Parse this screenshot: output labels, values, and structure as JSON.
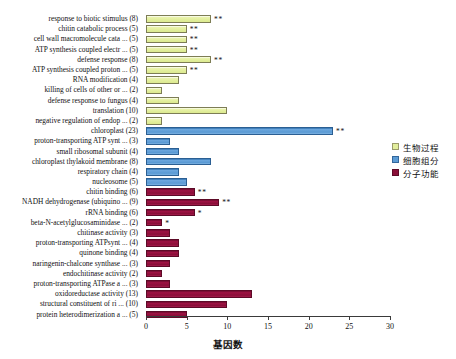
{
  "chart_data": {
    "type": "bar",
    "title": "",
    "orientation": "horizontal",
    "xlabel": "基因数",
    "ylabel": "",
    "xlim": [
      0,
      30
    ],
    "xticks": [
      0,
      5,
      10,
      15,
      20,
      25,
      30
    ],
    "xtick_labels": [
      "0",
      "5",
      "10",
      "15",
      "20",
      "25",
      "30"
    ],
    "grid": false,
    "legend_position": "right",
    "legend": [
      {
        "key": "bp",
        "label": "生物过程",
        "color": "#e2ee9c"
      },
      {
        "key": "cc",
        "label": "细胞组分",
        "color": "#5b9bd5"
      },
      {
        "key": "mf",
        "label": "分子功能",
        "color": "#8a0f38"
      }
    ],
    "categories": [
      "response to biotic stimulus (8)",
      "chitin catabolic process (5)",
      "cell wall macromolecule cata ... (5)",
      "ATP synthesis coupled electr ... (5)",
      "defense response (8)",
      "ATP synthesis coupled proton ... (5)",
      "RNA modification (4)",
      "killing of cells of other or ... (2)",
      "defense response to fungus (4)",
      "translation (10)",
      "negative regulation of endop ... (2)",
      "chloroplast (23)",
      "proton-transporting ATP synt ... (3)",
      "small ribosomal subunit (4)",
      "chloroplast thylakoid membrane (8)",
      "respiratory chain (4)",
      "nucleosome (5)",
      "chitin binding (6)",
      "NADH dehydrogenase (ubiquino ... (9)",
      "rRNA binding (6)",
      "beta-N-acetylglucosaminidase ... (2)",
      "chitinase activity (3)",
      "proton-transporting ATPsynt ... (4)",
      "quinone binding (4)",
      "naringenin-chalcone synthase ... (3)",
      "endochitinase activity (2)",
      "proton-transporting ATPase a ... (3)",
      "oxidoreductase activity (13)",
      "structural constituent of ri ... (10)",
      "protein heterodimerization a ... (5)"
    ],
    "values": [
      8,
      5,
      5,
      5,
      8,
      5,
      4,
      2,
      4,
      10,
      2,
      23,
      3,
      4,
      8,
      4,
      5,
      6,
      9,
      6,
      2,
      3,
      4,
      4,
      3,
      2,
      3,
      13,
      10,
      5
    ],
    "groups": [
      "bp",
      "bp",
      "bp",
      "bp",
      "bp",
      "bp",
      "bp",
      "bp",
      "bp",
      "bp",
      "bp",
      "cc",
      "cc",
      "cc",
      "cc",
      "cc",
      "cc",
      "mf",
      "mf",
      "mf",
      "mf",
      "mf",
      "mf",
      "mf",
      "mf",
      "mf",
      "mf",
      "mf",
      "mf",
      "mf"
    ],
    "significance": [
      "**",
      "**",
      "**",
      "**",
      "**",
      "**",
      "",
      "",
      "",
      "",
      "",
      "**",
      "",
      "",
      "",
      "",
      "",
      "**",
      "**",
      "*",
      "*",
      "",
      "",
      "",
      "",
      "",
      "",
      "",
      "",
      ""
    ]
  }
}
